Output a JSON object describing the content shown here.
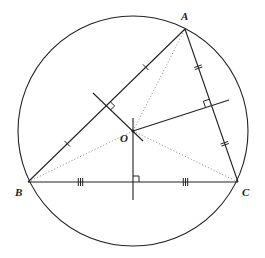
{
  "diagram": {
    "title": "",
    "stroke_color": "#222222",
    "dotted_color": "#999999",
    "circle": {
      "cx": 133,
      "cy": 131,
      "r": 115
    },
    "points": {
      "A": {
        "label": "A",
        "x": 185,
        "y": 29
      },
      "B": {
        "label": "B",
        "x": 28,
        "y": 182
      },
      "C": {
        "label": "C",
        "x": 238,
        "y": 182
      },
      "O": {
        "label": "O",
        "x": 133,
        "y": 131
      }
    },
    "labels": {
      "A": "A",
      "B": "B",
      "C": "C",
      "O": "O"
    },
    "perpendicular_bisectors": [
      {
        "side": "AB",
        "midpoint": [
          106,
          106
        ],
        "from": [
          93,
          93
        ],
        "to": [
          143,
          141
        ],
        "tick_marks": 1
      },
      {
        "side": "AC",
        "midpoint": [
          211,
          105
        ],
        "from": [
          133,
          131
        ],
        "to": [
          229,
          100
        ],
        "tick_marks": 2
      },
      {
        "side": "BC",
        "midpoint": [
          133,
          182
        ],
        "from": [
          133,
          118
        ],
        "to": [
          133,
          200
        ],
        "tick_marks": 3
      }
    ],
    "dotted_segments": [
      "OA",
      "OB",
      "OC"
    ]
  }
}
